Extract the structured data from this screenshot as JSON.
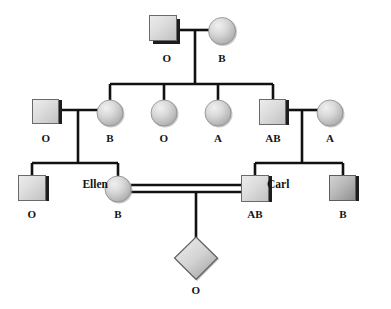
{
  "diagram": {
    "type": "pedigree-chart",
    "width": 391,
    "height": 309,
    "colors": {
      "line": "#111111",
      "background": "#ffffff",
      "shape_fill_light": "#e2e2e2",
      "shape_fill_mid": "#c9c9c9",
      "shape_fill_dark": "#9a9a9a",
      "shape_edge_shadow": "#2b2b2b",
      "label_text": "#141414"
    }
  },
  "generations": [
    {
      "id": "generation-1",
      "members": [
        {
          "id": "i-1",
          "shape": "square",
          "sex": "male",
          "label": "O",
          "name": "",
          "cx": 167,
          "cy": 32,
          "label_x": 167,
          "label_y": 59
        },
        {
          "id": "i-2",
          "shape": "circle",
          "sex": "female",
          "label": "B",
          "name": "",
          "cx": 222,
          "cy": 32,
          "label_x": 222,
          "label_y": 59
        }
      ]
    },
    {
      "id": "generation-2",
      "members": [
        {
          "id": "ii-1",
          "shape": "square",
          "sex": "male",
          "label": "O",
          "name": "",
          "cx": 46,
          "cy": 112,
          "label_x": 46,
          "label_y": 139
        },
        {
          "id": "ii-2",
          "shape": "circle",
          "sex": "female",
          "label": "B",
          "name": "",
          "cx": 110,
          "cy": 113,
          "label_x": 110,
          "label_y": 139
        },
        {
          "id": "ii-3",
          "shape": "circle",
          "sex": "female",
          "label": "O",
          "name": "",
          "cx": 164,
          "cy": 113,
          "label_x": 164,
          "label_y": 139
        },
        {
          "id": "ii-4",
          "shape": "circle",
          "sex": "female",
          "label": "A",
          "name": "",
          "cx": 218,
          "cy": 113,
          "label_x": 218,
          "label_y": 139
        },
        {
          "id": "ii-5",
          "shape": "square",
          "sex": "male",
          "label": "AB",
          "name": "",
          "cx": 273,
          "cy": 112,
          "label_x": 273,
          "label_y": 139
        },
        {
          "id": "ii-6",
          "shape": "circle",
          "sex": "female",
          "label": "A",
          "name": "",
          "cx": 330,
          "cy": 113,
          "label_x": 330,
          "label_y": 139
        }
      ]
    },
    {
      "id": "generation-3",
      "members": [
        {
          "id": "iii-1",
          "shape": "square",
          "sex": "male",
          "label": "O",
          "name": "",
          "cx": 32,
          "cy": 188,
          "label_x": 32,
          "label_y": 215
        },
        {
          "id": "iii-2",
          "shape": "circle",
          "sex": "female",
          "label": "B",
          "name": "Ellen",
          "cx": 118,
          "cy": 189,
          "label_x": 118,
          "label_y": 215,
          "name_side": "left",
          "name_x": 108,
          "name_y": 185
        },
        {
          "id": "iii-3",
          "shape": "square",
          "sex": "male",
          "label": "AB",
          "name": "Carl",
          "cx": 255,
          "cy": 188,
          "label_x": 255,
          "label_y": 215,
          "name_side": "right",
          "name_x": 267,
          "name_y": 185
        },
        {
          "id": "iii-4",
          "shape": "square",
          "sex": "male",
          "label": "B",
          "name": "",
          "cx": 343,
          "cy": 188,
          "label_x": 343,
          "label_y": 215
        }
      ]
    },
    {
      "id": "generation-4",
      "members": [
        {
          "id": "iv-1",
          "shape": "diamond",
          "sex": "unknown",
          "label": "O",
          "name": "",
          "cx": 196,
          "cy": 258,
          "label_x": 196,
          "label_y": 290
        }
      ]
    }
  ],
  "unions": [
    {
      "id": "union-1",
      "partners": [
        "i-1",
        "i-2"
      ],
      "line": "single",
      "children": [
        "ii-2",
        "ii-3",
        "ii-4",
        "ii-5"
      ]
    },
    {
      "id": "union-2",
      "partners": [
        "ii-1",
        "ii-2"
      ],
      "line": "single",
      "children": [
        "iii-1",
        "iii-2"
      ]
    },
    {
      "id": "union-3",
      "partners": [
        "ii-5",
        "ii-6"
      ],
      "line": "single",
      "children": [
        "iii-3",
        "iii-4"
      ]
    },
    {
      "id": "union-4",
      "partners": [
        "iii-2",
        "iii-3"
      ],
      "line": "double",
      "children": [
        "iv-1"
      ],
      "consanguineous": true
    }
  ],
  "legend": {
    "square_means": "male",
    "circle_means": "female",
    "diamond_means": "sex unspecified",
    "label_means": "ABO blood type"
  }
}
